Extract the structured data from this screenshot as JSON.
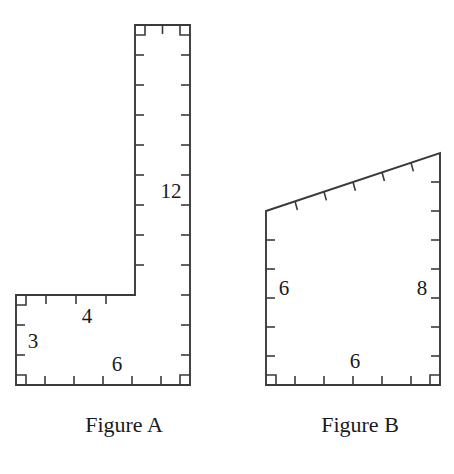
{
  "page": {
    "background_color": "#ffffff",
    "line_color": "#3a3a3a",
    "text_color": "#1a1a1a",
    "width": 454,
    "height": 474
  },
  "figure_a": {
    "caption": "Figure A",
    "caption_x": 124,
    "caption_y": 432,
    "shape": "L-shaped polygon",
    "outline_points": "135,25 190,25 190,385 16,385 16,295 135,295",
    "labels": [
      {
        "name": "vertical-height",
        "text": "12",
        "x": 171,
        "y": 193
      },
      {
        "name": "foot-top-width",
        "text": "4",
        "x": 87,
        "y": 318
      },
      {
        "name": "foot-left-height",
        "text": "3",
        "x": 33,
        "y": 343
      },
      {
        "name": "bottom-width",
        "text": "6",
        "x": 117,
        "y": 366
      }
    ],
    "ticks": [
      {
        "name": "tick-top-1",
        "x1": 162.5,
        "y1": 25,
        "x2": 162.5,
        "y2": 34
      },
      {
        "name": "tick-right-1",
        "x1": 190,
        "y1": 55,
        "x2": 181,
        "y2": 55
      },
      {
        "name": "tick-right-2",
        "x1": 190,
        "y1": 85,
        "x2": 181,
        "y2": 85
      },
      {
        "name": "tick-right-3",
        "x1": 190,
        "y1": 115,
        "x2": 181,
        "y2": 115
      },
      {
        "name": "tick-right-4",
        "x1": 190,
        "y1": 145,
        "x2": 181,
        "y2": 145
      },
      {
        "name": "tick-right-5",
        "x1": 190,
        "y1": 175,
        "x2": 181,
        "y2": 175
      },
      {
        "name": "tick-right-6",
        "x1": 190,
        "y1": 205,
        "x2": 181,
        "y2": 205
      },
      {
        "name": "tick-right-7",
        "x1": 190,
        "y1": 235,
        "x2": 181,
        "y2": 235
      },
      {
        "name": "tick-right-8",
        "x1": 190,
        "y1": 265,
        "x2": 181,
        "y2": 265
      },
      {
        "name": "tick-right-9",
        "x1": 190,
        "y1": 295,
        "x2": 181,
        "y2": 295
      },
      {
        "name": "tick-right-10",
        "x1": 190,
        "y1": 325,
        "x2": 181,
        "y2": 325
      },
      {
        "name": "tick-right-11",
        "x1": 190,
        "y1": 355,
        "x2": 181,
        "y2": 355
      },
      {
        "name": "tick-inner-1",
        "x1": 135,
        "y1": 55,
        "x2": 144,
        "y2": 55
      },
      {
        "name": "tick-inner-2",
        "x1": 135,
        "y1": 85,
        "x2": 144,
        "y2": 85
      },
      {
        "name": "tick-inner-3",
        "x1": 135,
        "y1": 115,
        "x2": 144,
        "y2": 115
      },
      {
        "name": "tick-inner-4",
        "x1": 135,
        "y1": 145,
        "x2": 144,
        "y2": 145
      },
      {
        "name": "tick-inner-5",
        "x1": 135,
        "y1": 175,
        "x2": 144,
        "y2": 175
      },
      {
        "name": "tick-inner-6",
        "x1": 135,
        "y1": 205,
        "x2": 144,
        "y2": 205
      },
      {
        "name": "tick-inner-7",
        "x1": 135,
        "y1": 235,
        "x2": 144,
        "y2": 235
      },
      {
        "name": "tick-inner-8",
        "x1": 135,
        "y1": 265,
        "x2": 144,
        "y2": 265
      },
      {
        "name": "tick-foottop-1",
        "x1": 46,
        "y1": 295,
        "x2": 46,
        "y2": 304
      },
      {
        "name": "tick-foottop-2",
        "x1": 76,
        "y1": 295,
        "x2": 76,
        "y2": 304
      },
      {
        "name": "tick-foottop-3",
        "x1": 106,
        "y1": 295,
        "x2": 106,
        "y2": 304
      },
      {
        "name": "tick-left-1",
        "x1": 16,
        "y1": 325,
        "x2": 25,
        "y2": 325
      },
      {
        "name": "tick-left-2",
        "x1": 16,
        "y1": 355,
        "x2": 25,
        "y2": 355
      },
      {
        "name": "tick-bottom-1",
        "x1": 45,
        "y1": 385,
        "x2": 45,
        "y2": 376
      },
      {
        "name": "tick-bottom-2",
        "x1": 74,
        "y1": 385,
        "x2": 74,
        "y2": 376
      },
      {
        "name": "tick-bottom-3",
        "x1": 103,
        "y1": 385,
        "x2": 103,
        "y2": 376
      },
      {
        "name": "tick-bottom-4",
        "x1": 132,
        "y1": 385,
        "x2": 132,
        "y2": 376
      },
      {
        "name": "tick-bottom-5",
        "x1": 161,
        "y1": 385,
        "x2": 161,
        "y2": 376
      }
    ],
    "right_angles": [
      {
        "name": "right-angle-top-left",
        "points": "135,35 145,35 145,25"
      },
      {
        "name": "right-angle-top-right",
        "points": "180,25 180,35 190,35"
      },
      {
        "name": "right-angle-foot-top-left",
        "points": "16,305 26,305 26,295"
      },
      {
        "name": "right-angle-bottom-left",
        "points": "16,375 26,375 26,385"
      },
      {
        "name": "right-angle-bottom-right",
        "points": "180,385 180,375 190,375"
      }
    ]
  },
  "figure_b": {
    "caption": "Figure B",
    "caption_x": 360,
    "caption_y": 432,
    "shape": "right trapezoid",
    "outline_points": "266,211 440,153 440,385 266,385",
    "labels": [
      {
        "name": "left-height",
        "text": "6",
        "x": 284,
        "y": 290
      },
      {
        "name": "right-height",
        "text": "8",
        "x": 422,
        "y": 290
      },
      {
        "name": "bottom-width",
        "text": "6",
        "x": 355,
        "y": 363
      }
    ],
    "ticks": [
      {
        "name": "tick-slant-1",
        "x1": 295.0,
        "y1": 201.3,
        "x2": 297.4,
        "y2": 210.0
      },
      {
        "name": "tick-slant-2",
        "x1": 324.0,
        "y1": 191.7,
        "x2": 326.4,
        "y2": 200.4
      },
      {
        "name": "tick-slant-3",
        "x1": 353.0,
        "y1": 182.0,
        "x2": 355.4,
        "y2": 190.7
      },
      {
        "name": "tick-slant-4",
        "x1": 382.0,
        "y1": 172.3,
        "x2": 384.4,
        "y2": 181.0
      },
      {
        "name": "tick-slant-5",
        "x1": 411.0,
        "y1": 162.7,
        "x2": 413.4,
        "y2": 171.4
      },
      {
        "name": "tick-left-1",
        "x1": 266,
        "y1": 240,
        "x2": 275,
        "y2": 240
      },
      {
        "name": "tick-left-2",
        "x1": 266,
        "y1": 269,
        "x2": 275,
        "y2": 269
      },
      {
        "name": "tick-left-3",
        "x1": 266,
        "y1": 298,
        "x2": 275,
        "y2": 298
      },
      {
        "name": "tick-left-4",
        "x1": 266,
        "y1": 327,
        "x2": 275,
        "y2": 327
      },
      {
        "name": "tick-left-5",
        "x1": 266,
        "y1": 356,
        "x2": 275,
        "y2": 356
      },
      {
        "name": "tick-right-1",
        "x1": 440,
        "y1": 182,
        "x2": 431,
        "y2": 182
      },
      {
        "name": "tick-right-2",
        "x1": 440,
        "y1": 211,
        "x2": 431,
        "y2": 211
      },
      {
        "name": "tick-right-3",
        "x1": 440,
        "y1": 240,
        "x2": 431,
        "y2": 240
      },
      {
        "name": "tick-right-4",
        "x1": 440,
        "y1": 269,
        "x2": 431,
        "y2": 269
      },
      {
        "name": "tick-right-5",
        "x1": 440,
        "y1": 298,
        "x2": 431,
        "y2": 298
      },
      {
        "name": "tick-right-6",
        "x1": 440,
        "y1": 327,
        "x2": 431,
        "y2": 327
      },
      {
        "name": "tick-right-7",
        "x1": 440,
        "y1": 356,
        "x2": 431,
        "y2": 356
      },
      {
        "name": "tick-bottom-1",
        "x1": 295,
        "y1": 385,
        "x2": 295,
        "y2": 376
      },
      {
        "name": "tick-bottom-2",
        "x1": 324,
        "y1": 385,
        "x2": 324,
        "y2": 376
      },
      {
        "name": "tick-bottom-3",
        "x1": 353,
        "y1": 385,
        "x2": 353,
        "y2": 376
      },
      {
        "name": "tick-bottom-4",
        "x1": 382,
        "y1": 385,
        "x2": 382,
        "y2": 376
      },
      {
        "name": "tick-bottom-5",
        "x1": 411,
        "y1": 385,
        "x2": 411,
        "y2": 376
      }
    ],
    "right_angles": [
      {
        "name": "right-angle-bottom-left",
        "points": "266,375 276,375 276,385"
      },
      {
        "name": "right-angle-bottom-right",
        "points": "430,385 430,375 440,375"
      }
    ]
  }
}
